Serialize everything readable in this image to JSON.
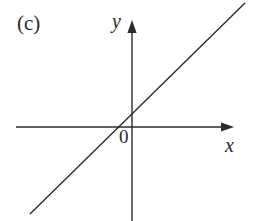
{
  "figure": {
    "panel_label": "(c)",
    "background_color": "#ffffff",
    "ink_color": "#2b2b2b",
    "width": 256,
    "height": 221
  },
  "axes": {
    "x_label": "x",
    "y_label": "y",
    "origin_label": "0",
    "x_axis": {
      "name": "x-axis",
      "y_position": 127,
      "start_x": 16,
      "end_x": 234,
      "arrow": "right"
    },
    "y_axis": {
      "name": "y-axis",
      "x_position": 132,
      "start_y": 221,
      "end_y": 20,
      "arrow": "up"
    }
  },
  "chart_data": {
    "type": "line",
    "title": "(c)",
    "xlabel": "x",
    "ylabel": "y",
    "grid": false,
    "legend": null,
    "annotations": [
      "0"
    ],
    "series": [
      {
        "name": "linear-function",
        "kind": "straight-line",
        "slope_sign": "positive",
        "x": [
          30,
          245
        ],
        "y": [
          214,
          3
        ],
        "x_intercept_px": 123,
        "y_intercept_px": 118
      }
    ]
  }
}
